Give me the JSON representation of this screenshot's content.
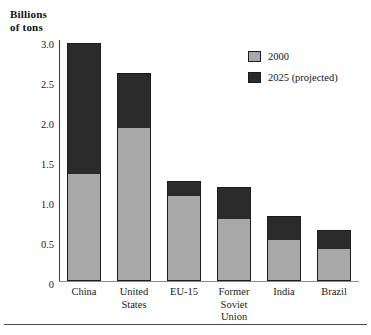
{
  "chart_data": {
    "type": "bar",
    "subtype": "stacked-vertical",
    "title": "",
    "xlabel": "",
    "ylabel": "Billions of tons",
    "ylabel_lines": [
      "Billions",
      "of tons"
    ],
    "ylim": [
      0,
      3.0
    ],
    "yticks": [
      "3.0",
      "2.5",
      "2.0",
      "1.5",
      "1.0",
      "0.5",
      "0"
    ],
    "ytick_values": [
      3.0,
      2.5,
      2.0,
      1.5,
      1.0,
      0.5,
      0
    ],
    "grid": false,
    "legend_position": "top-right",
    "categories": [
      "China",
      "United States",
      "EU-15",
      "Former Soviet Union",
      "India",
      "Brazil"
    ],
    "category_label_lines": [
      [
        "China"
      ],
      [
        "United",
        "States"
      ],
      [
        "EU-15"
      ],
      [
        "Former",
        "Soviet",
        "Union"
      ],
      [
        "India"
      ],
      [
        "Brazil"
      ]
    ],
    "series": [
      {
        "name": "2000",
        "color": "#a8a8a8",
        "values": [
          1.33,
          1.9,
          1.06,
          0.77,
          0.51,
          0.4
        ]
      },
      {
        "name": "2025 (projected)",
        "color": "#2b2b2b",
        "values": [
          1.63,
          0.69,
          0.19,
          0.4,
          0.3,
          0.23
        ]
      }
    ],
    "totals": [
      2.96,
      2.59,
      1.25,
      1.17,
      0.81,
      0.63
    ]
  },
  "legend": {
    "items": [
      {
        "label": "2000",
        "color": "#a8a8a8"
      },
      {
        "label": "2025 (projected)",
        "color": "#2b2b2b"
      }
    ]
  },
  "colors": {
    "series_2000": "#a8a8a8",
    "series_2025": "#2b2b2b",
    "axis": "#3a3a3a",
    "baseline": "#8a8a8a",
    "text": "#141414",
    "rule": "#4a4a4a",
    "background": "#ffffff"
  }
}
